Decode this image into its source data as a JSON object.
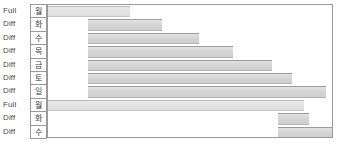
{
  "chart_data": {
    "type": "bar",
    "title": "",
    "xlabel": "",
    "ylabel": "",
    "orientation": "horizontal",
    "grid": false,
    "legend": null,
    "xlim": [
      0,
      100
    ],
    "categories": [
      "월",
      "화",
      "수",
      "목",
      "금",
      "토",
      "일",
      "월",
      "화",
      "수"
    ],
    "category_labels_en": [
      "Mon",
      "Tue",
      "Wed",
      "Thu",
      "Fri",
      "Sat",
      "Sun",
      "Mon",
      "Tue",
      "Wed"
    ],
    "backup_types": [
      "Full",
      "Diff",
      "Diff",
      "Diff",
      "Diff",
      "Diff",
      "Diff",
      "Full",
      "Diff",
      "Diff"
    ],
    "bars": [
      {
        "type": "Full",
        "day": "월",
        "start": 0.0,
        "end": 29.0
      },
      {
        "type": "Diff",
        "day": "화",
        "start": 14.0,
        "end": 40.0
      },
      {
        "type": "Diff",
        "day": "수",
        "start": 14.0,
        "end": 53.0
      },
      {
        "type": "Diff",
        "day": "목",
        "start": 14.0,
        "end": 65.0
      },
      {
        "type": "Diff",
        "day": "금",
        "start": 14.0,
        "end": 79.0
      },
      {
        "type": "Diff",
        "day": "토",
        "start": 14.0,
        "end": 86.0
      },
      {
        "type": "Diff",
        "day": "일",
        "start": 14.0,
        "end": 98.0
      },
      {
        "type": "Full",
        "day": "월",
        "start": 0.0,
        "end": 90.0
      },
      {
        "type": "Diff",
        "day": "화",
        "start": 81.0,
        "end": 92.0
      },
      {
        "type": "Diff",
        "day": "수",
        "start": 81.0,
        "end": 100.0
      }
    ],
    "colors": {
      "bar_diff_fill": "#d5d5d5",
      "bar_full_fill": "#e3e3e3",
      "bar_border": "#9c9c9c",
      "frame_border": "#9a9a9a",
      "label_text": "#4a4a4a",
      "background": "#ffffff"
    }
  },
  "rows": [
    {
      "type": "Full",
      "day": "월"
    },
    {
      "type": "Diff",
      "day": "화"
    },
    {
      "type": "Diff",
      "day": "수"
    },
    {
      "type": "Diff",
      "day": "목"
    },
    {
      "type": "Diff",
      "day": "금"
    },
    {
      "type": "Diff",
      "day": "토"
    },
    {
      "type": "Diff",
      "day": "일"
    },
    {
      "type": "Full",
      "day": "월"
    },
    {
      "type": "Diff",
      "day": "화"
    },
    {
      "type": "Diff",
      "day": "수"
    }
  ]
}
